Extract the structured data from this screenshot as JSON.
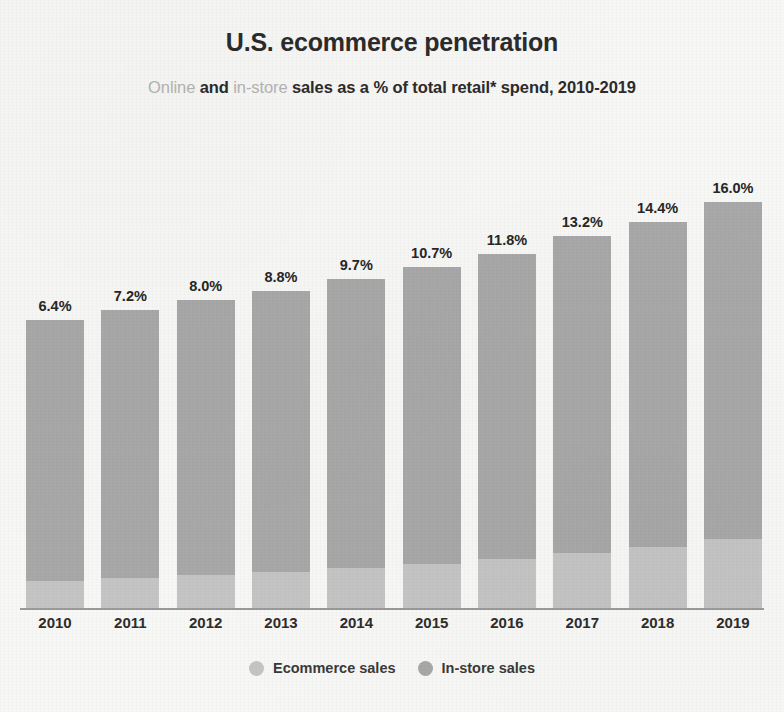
{
  "chart_data": {
    "type": "bar",
    "stacked": true,
    "title": "U.S. ecommerce penetration",
    "subtitle_parts": [
      {
        "text": "Online",
        "style": "muted"
      },
      {
        "text": " and ",
        "style": "bold"
      },
      {
        "text": "in-store",
        "style": "muted"
      },
      {
        "text": " sales as a % of total retail* spend, 2010-2019",
        "style": "bold"
      }
    ],
    "subtitle": "Online and in-store sales as a % of total retail* spend, 2010-2019",
    "categories": [
      "2010",
      "2011",
      "2012",
      "2013",
      "2014",
      "2015",
      "2016",
      "2017",
      "2018",
      "2019"
    ],
    "values": [
      6.4,
      7.2,
      8.0,
      8.8,
      9.7,
      10.7,
      11.8,
      13.2,
      14.4,
      16.0
    ],
    "value_labels": [
      "6.4%",
      "7.2%",
      "8.0%",
      "8.8%",
      "9.7%",
      "10.7%",
      "11.8%",
      "13.2%",
      "14.4%",
      "16.0%"
    ],
    "series": [
      {
        "name": "Ecommerce sales",
        "color": "#c4c4c4",
        "values": [
          6.4,
          7.2,
          8.0,
          8.8,
          9.7,
          10.7,
          11.8,
          13.2,
          14.4,
          16.0
        ]
      },
      {
        "name": "In-store sales",
        "color": "#a8a8a8",
        "values": [
          93.6,
          92.8,
          92.0,
          91.2,
          90.3,
          89.3,
          88.2,
          86.8,
          85.6,
          84.0
        ]
      }
    ],
    "xlabel": "",
    "ylabel": "",
    "ylim": [
      0,
      100
    ],
    "grid": false,
    "legend_position": "bottom",
    "axis_line_color": "#9a9a9a",
    "background_color": "#f7f7f5",
    "text_color": "#2b2b2b",
    "muted_text_color": "#b4b4b4"
  },
  "legend": {
    "items": [
      {
        "label": "Ecommerce sales",
        "color": "#c4c4c4"
      },
      {
        "label": "In-store sales",
        "color": "#a8a8a8"
      }
    ]
  }
}
